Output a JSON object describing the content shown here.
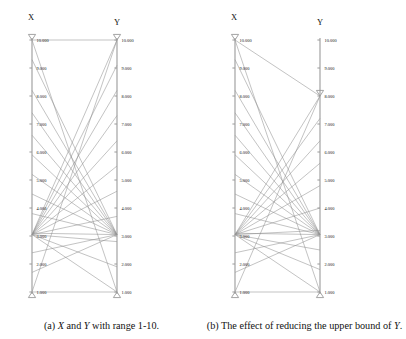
{
  "figure": {
    "width": 406,
    "height": 339,
    "background": "#ffffff",
    "line_color": "#8c8c8c",
    "axis_color": "#9a9a9a",
    "text_color": "#111111",
    "tick_label_format": "0.000"
  },
  "subfigures": [
    {
      "id": "a",
      "caption_prefix": "(a)",
      "caption": "(a) X and Y with range 1-10.",
      "caption_parts": [
        "(a) ",
        "X",
        " and ",
        "Y",
        " with range 1-10."
      ],
      "axes": [
        {
          "name": "X",
          "label": "X",
          "side": "left",
          "min": 1,
          "max": 10,
          "domain_min_label": "1.000",
          "domain_max_label": "10.000",
          "marker_top_value": 10,
          "marker_bottom_value": 1,
          "marker_top_shape": "triangle-down",
          "marker_bottom_shape": "triangle-up",
          "ticks": [
            {
              "value": 10,
              "label": "10.000"
            },
            {
              "value": 9,
              "label": "9.000"
            },
            {
              "value": 8,
              "label": "8.000"
            },
            {
              "value": 7,
              "label": "7.000"
            },
            {
              "value": 6,
              "label": "6.000"
            },
            {
              "value": 5,
              "label": "5.000"
            },
            {
              "value": 4,
              "label": "4.000"
            },
            {
              "value": 3,
              "label": "3.000"
            },
            {
              "value": 2,
              "label": "2.000"
            },
            {
              "value": 1,
              "label": "1.000"
            }
          ]
        },
        {
          "name": "Y",
          "label": "Y",
          "side": "right",
          "min": 1,
          "max": 10,
          "domain_min_label": "1.000",
          "domain_max_label": "10.000",
          "marker_top_value": 10,
          "marker_bottom_value": 1,
          "marker_top_shape": "triangle-down",
          "marker_bottom_shape": "triangle-up",
          "ticks": [
            {
              "value": 10,
              "label": "10.000"
            },
            {
              "value": 9,
              "label": "9.000"
            },
            {
              "value": 8,
              "label": "8.000"
            },
            {
              "value": 7,
              "label": "7.000"
            },
            {
              "value": 6,
              "label": "6.000"
            },
            {
              "value": 5,
              "label": "5.000"
            },
            {
              "value": 4,
              "label": "4.000"
            },
            {
              "value": 3,
              "label": "3.000"
            },
            {
              "value": 2,
              "label": "2.000"
            },
            {
              "value": 1,
              "label": "1.000"
            }
          ]
        }
      ],
      "links": [
        {
          "x": 10,
          "y": 10
        },
        {
          "x": 10,
          "y": 1
        },
        {
          "x": 1,
          "y": 1
        },
        {
          "x": 1,
          "y": 10
        },
        {
          "x": 9.3,
          "y": 3.05
        },
        {
          "x": 8.2,
          "y": 3.05
        },
        {
          "x": 7.4,
          "y": 3.05
        },
        {
          "x": 6.6,
          "y": 3.05
        },
        {
          "x": 5.9,
          "y": 3.05
        },
        {
          "x": 5.2,
          "y": 3.05
        },
        {
          "x": 4.5,
          "y": 3.05
        },
        {
          "x": 3.8,
          "y": 3.05
        },
        {
          "x": 3.1,
          "y": 3.05
        },
        {
          "x": 2.4,
          "y": 3.05
        },
        {
          "x": 1.7,
          "y": 3.05
        },
        {
          "x": 3.05,
          "y": 10
        },
        {
          "x": 3.05,
          "y": 9.1
        },
        {
          "x": 3.05,
          "y": 8.2
        },
        {
          "x": 3.05,
          "y": 7.3
        },
        {
          "x": 3.05,
          "y": 6.4
        },
        {
          "x": 3.05,
          "y": 5.5
        },
        {
          "x": 3.05,
          "y": 4.6
        },
        {
          "x": 3.05,
          "y": 3.7
        },
        {
          "x": 3.05,
          "y": 2.8
        },
        {
          "x": 3.05,
          "y": 1.9
        },
        {
          "x": 3.05,
          "y": 1.0
        }
      ]
    },
    {
      "id": "b",
      "caption_prefix": "(b)",
      "caption": "(b) The effect of reducing the upper bound of Y.",
      "caption_parts": [
        "(b) The effect of reducing the upper bound of ",
        "Y",
        "."
      ],
      "axes": [
        {
          "name": "X",
          "label": "X",
          "side": "left",
          "min": 1,
          "max": 10,
          "domain_min_label": "1.000",
          "domain_max_label": "10.000",
          "marker_top_value": 10,
          "marker_bottom_value": 1,
          "marker_top_shape": "triangle-down",
          "marker_bottom_shape": "triangle-up",
          "ticks": [
            {
              "value": 10,
              "label": "10.000"
            },
            {
              "value": 9,
              "label": "9.000"
            },
            {
              "value": 8,
              "label": "8.000"
            },
            {
              "value": 7,
              "label": "7.000"
            },
            {
              "value": 6,
              "label": "6.000"
            },
            {
              "value": 5,
              "label": "5.000"
            },
            {
              "value": 4,
              "label": "4.000"
            },
            {
              "value": 3,
              "label": "3.000"
            },
            {
              "value": 2,
              "label": "2.000"
            },
            {
              "value": 1,
              "label": "1.000"
            }
          ]
        },
        {
          "name": "Y",
          "label": "Y",
          "side": "right",
          "min": 1,
          "max": 8,
          "domain_min_label": "1.000",
          "domain_max_label": "8.000",
          "marker_top_value": 8,
          "marker_bottom_value": 1,
          "marker_top_shape": "triangle-down",
          "marker_bottom_shape": "triangle-up",
          "ticks": [
            {
              "value": 10,
              "label": "10.000"
            },
            {
              "value": 9,
              "label": "9.000"
            },
            {
              "value": 8,
              "label": "8.000"
            },
            {
              "value": 7,
              "label": "7.000"
            },
            {
              "value": 6,
              "label": "6.000"
            },
            {
              "value": 5,
              "label": "5.000"
            },
            {
              "value": 4,
              "label": "4.000"
            },
            {
              "value": 3,
              "label": "3.000"
            },
            {
              "value": 2,
              "label": "2.000"
            },
            {
              "value": 1,
              "label": "1.000"
            }
          ]
        }
      ],
      "links": [
        {
          "x": 10,
          "y": 8
        },
        {
          "x": 10,
          "y": 1
        },
        {
          "x": 1,
          "y": 1
        },
        {
          "x": 1,
          "y": 8
        },
        {
          "x": 9.3,
          "y": 3.05
        },
        {
          "x": 8.2,
          "y": 3.05
        },
        {
          "x": 7.4,
          "y": 3.05
        },
        {
          "x": 6.6,
          "y": 3.05
        },
        {
          "x": 5.9,
          "y": 3.05
        },
        {
          "x": 5.2,
          "y": 3.05
        },
        {
          "x": 4.5,
          "y": 3.05
        },
        {
          "x": 3.8,
          "y": 3.05
        },
        {
          "x": 3.1,
          "y": 3.05
        },
        {
          "x": 2.4,
          "y": 3.05
        },
        {
          "x": 1.7,
          "y": 3.05
        },
        {
          "x": 3.05,
          "y": 8
        },
        {
          "x": 3.05,
          "y": 7.2
        },
        {
          "x": 3.05,
          "y": 6.4
        },
        {
          "x": 3.05,
          "y": 5.6
        },
        {
          "x": 3.05,
          "y": 4.8
        },
        {
          "x": 3.05,
          "y": 4.0
        },
        {
          "x": 3.05,
          "y": 3.2
        },
        {
          "x": 3.05,
          "y": 2.5
        },
        {
          "x": 3.05,
          "y": 1.8
        },
        {
          "x": 3.05,
          "y": 1.0
        }
      ]
    }
  ],
  "chart_data": {
    "type": "line",
    "chart_style": "parallel-coordinates",
    "title": "",
    "panels": [
      {
        "panel": "a",
        "caption": "(a) X and Y with range 1-10.",
        "axis_names": [
          "X",
          "Y"
        ],
        "axis_ranges": {
          "X": [
            1,
            10
          ],
          "Y": [
            1,
            10
          ]
        },
        "bound_markers": {
          "X": [
            1,
            10
          ],
          "Y": [
            1,
            10
          ]
        },
        "tick_values": [
          1,
          2,
          3,
          4,
          5,
          6,
          7,
          8,
          9,
          10
        ],
        "tick_labels": [
          "1.000",
          "2.000",
          "3.000",
          "4.000",
          "5.000",
          "6.000",
          "7.000",
          "8.000",
          "9.000",
          "10.000"
        ]
      },
      {
        "panel": "b",
        "caption": "(b) The effect of reducing the upper bound of Y.",
        "axis_names": [
          "X",
          "Y"
        ],
        "axis_ranges": {
          "X": [
            1,
            10
          ],
          "Y": [
            1,
            8
          ]
        },
        "bound_markers": {
          "X": [
            1,
            10
          ],
          "Y": [
            1,
            8
          ]
        },
        "tick_values": [
          1,
          2,
          3,
          4,
          5,
          6,
          7,
          8,
          9,
          10
        ],
        "tick_labels": [
          "1.000",
          "2.000",
          "3.000",
          "4.000",
          "5.000",
          "6.000",
          "7.000",
          "8.000",
          "9.000",
          "10.000"
        ]
      }
    ],
    "xlabel": "",
    "ylabel": "",
    "grid": false,
    "legend": "none"
  }
}
